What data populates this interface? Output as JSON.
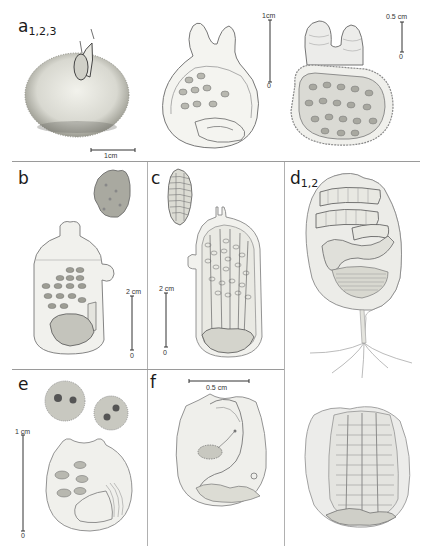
{
  "figure": {
    "panels": [
      {
        "id": "a",
        "label": "a",
        "subscripts": "1,2,3",
        "scale_bars": [
          {
            "label": "1cm",
            "zero": ""
          },
          {
            "label": "1cm",
            "zero": "0"
          },
          {
            "label": "0.5 cm",
            "zero": "0"
          }
        ]
      },
      {
        "id": "b",
        "label": "b",
        "subscripts": "",
        "scale_bars": [
          {
            "label": "2 cm",
            "zero": "0"
          }
        ]
      },
      {
        "id": "c",
        "label": "c",
        "subscripts": "",
        "scale_bars": [
          {
            "label": "2 cm",
            "zero": "0"
          }
        ]
      },
      {
        "id": "d",
        "label": "d",
        "subscripts": "1,2",
        "scale_bars": []
      },
      {
        "id": "e",
        "label": "e",
        "subscripts": "",
        "scale_bars": [
          {
            "label": "1 cm",
            "zero": "0"
          }
        ]
      },
      {
        "id": "f",
        "label": "f",
        "subscripts": "",
        "scale_bars": [
          {
            "label": "0.5 cm",
            "zero": ""
          }
        ]
      }
    ]
  }
}
